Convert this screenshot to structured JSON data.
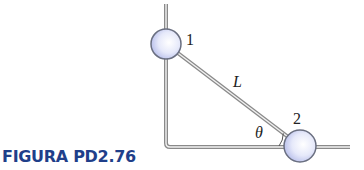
{
  "caption": "FIGURA PD2.76",
  "labels": {
    "ball1": "1",
    "ball2": "2",
    "rod": "L",
    "angle": "θ"
  },
  "colors": {
    "caption": "#1f3f8a",
    "rail": "#8a8a8a",
    "ball_fill": "#dfe4f8",
    "ball_stroke": "#6a6f80"
  }
}
